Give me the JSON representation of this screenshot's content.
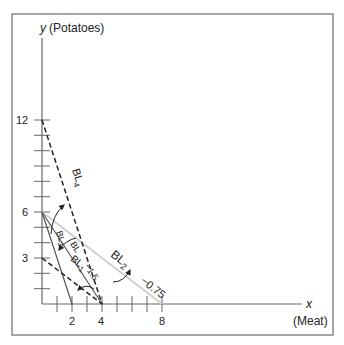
{
  "axes": {
    "y_label_var": "y",
    "y_label_name": "(Potatoes)",
    "x_label_var": "x",
    "x_label_name": "(Meat)",
    "y_ticks": [
      "12",
      "6",
      "3"
    ],
    "x_ticks": [
      "2",
      "4",
      "8"
    ]
  },
  "lines": {
    "bl": {
      "label": "BL",
      "slope_label": "−1.5"
    },
    "bl1": {
      "label": "BL",
      "sub": "1"
    },
    "bl2": {
      "label": "BL",
      "sub": "2",
      "slope_label": "−0.75"
    },
    "bl3": {
      "label": "BL",
      "sub": "3"
    },
    "bl4": {
      "label": "BL",
      "sub": "4"
    }
  },
  "colors": {
    "axis": "#666666",
    "line_dark": "#444444",
    "line_light": "#d0d0d0",
    "frame": "#888888"
  }
}
